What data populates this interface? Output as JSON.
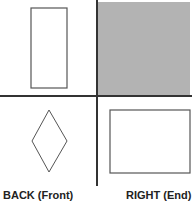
{
  "diagram": {
    "type": "orthographic-projection-views",
    "colors": {
      "background": "#ffffff",
      "line": "#333333",
      "shape_stroke": "#555555",
      "shaded_quadrant": "#b3b3b3"
    },
    "quadrants": [
      {
        "position": "top-left",
        "shape": "tall-rectangle",
        "shaded": false
      },
      {
        "position": "top-right",
        "shape": "none",
        "shaded": true
      },
      {
        "position": "bottom-left",
        "shape": "diamond",
        "shaded": false,
        "label": "BACK (Front)"
      },
      {
        "position": "bottom-right",
        "shape": "wide-rectangle",
        "shaded": false,
        "label": "RIGHT (End)"
      }
    ],
    "labels": {
      "bottom_left": "BACK (Front)",
      "bottom_right": "RIGHT (End)"
    }
  }
}
